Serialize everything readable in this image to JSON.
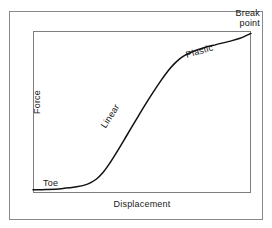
{
  "figure": {
    "background_color": "#ffffff",
    "frame_color": "#8a8a8a",
    "axes_color": "#7d7d7d",
    "curve_color": "#111111"
  },
  "axes": {
    "ylabel": "Force",
    "xlabel": "Displacement"
  },
  "annotations": {
    "toe": "Toe",
    "linear": "Linear",
    "plastic": "Plastic",
    "break_point_line1": "Break",
    "break_point_line2": "point"
  },
  "chart_data": {
    "type": "line",
    "title": "",
    "subtitle": "",
    "xlabel": "Displacement",
    "ylabel": "Force",
    "xlim": [
      0,
      1
    ],
    "ylim": [
      0,
      1
    ],
    "grid": false,
    "legend": null,
    "axis_ticks": {
      "x": [],
      "y": []
    },
    "series": [
      {
        "name": "Force-displacement curve",
        "comment": "Normalized coordinates: x and y in 0..1 of the plot box; sigmoid toe/linear/plastic shape ending at break point",
        "x": [
          0.0,
          0.06,
          0.13,
          0.2,
          0.25,
          0.29,
          0.32,
          0.35,
          0.39,
          0.43,
          0.47,
          0.51,
          0.55,
          0.59,
          0.62,
          0.65,
          0.68,
          0.72,
          0.78,
          0.84,
          0.9,
          0.95,
          1.0
        ],
        "y": [
          0.02,
          0.022,
          0.027,
          0.038,
          0.055,
          0.085,
          0.125,
          0.18,
          0.265,
          0.355,
          0.445,
          0.535,
          0.62,
          0.7,
          0.755,
          0.8,
          0.836,
          0.866,
          0.895,
          0.916,
          0.936,
          0.955,
          0.985
        ]
      }
    ],
    "regions": [
      {
        "label": "Toe",
        "x_range": [
          0.0,
          0.26
        ],
        "description": "initial low-stiffness flat region"
      },
      {
        "label": "Linear",
        "x_range": [
          0.26,
          0.63
        ],
        "description": "steep straight-line elastic region"
      },
      {
        "label": "Plastic",
        "x_range": [
          0.63,
          1.0
        ],
        "description": "flattening plastic deformation region"
      }
    ],
    "markers": [
      {
        "label": "Break point",
        "x": 1.0,
        "y": 0.985,
        "description": "curve terminates at upper-right corner of plot box"
      }
    ]
  }
}
